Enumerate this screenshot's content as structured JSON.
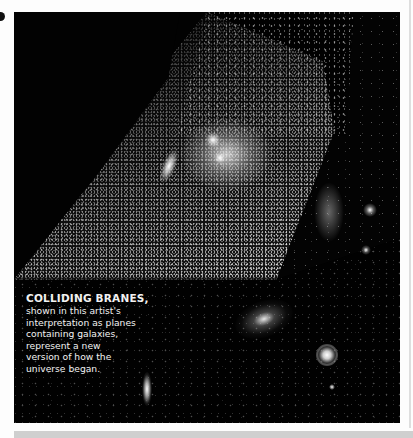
{
  "figure": {
    "caption": {
      "title": "COLLIDING BRANES,",
      "lines": [
        "shown in this artist's",
        "interpretation as planes",
        "containing galaxies,",
        "represent a new",
        "version of how the",
        "universe began."
      ]
    }
  },
  "colors": {
    "page_background": "#fdfdfd",
    "image_background": "#020202",
    "caption_text": "#f2f2f2",
    "bottom_strip": "#cfcfcf"
  }
}
